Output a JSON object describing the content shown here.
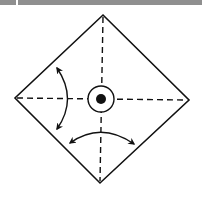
{
  "diagram": {
    "type": "origami-fold-instruction",
    "shape": "square-rotated-diamond",
    "fold_lines": [
      "vertical-dashed",
      "horizontal-dashed"
    ],
    "center_marker": "circled-dot",
    "arrows": [
      "curved-double-arrow-left",
      "curved-double-arrow-bottom"
    ],
    "colors": {
      "line": "#111111",
      "background": "#ffffff",
      "top_bar": "#8f8f8f"
    }
  }
}
